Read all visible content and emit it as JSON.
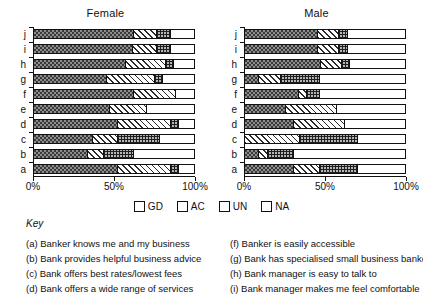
{
  "chart_data": {
    "type": "bar",
    "subtype": "stacked-horizontal-100-percent",
    "title": "",
    "panels": [
      {
        "title": "Female",
        "categories": [
          "a",
          "b",
          "c",
          "d",
          "e",
          "f",
          "g",
          "h",
          "i",
          "j"
        ],
        "series": [
          {
            "name": "GD",
            "values": [
              52,
              33,
              36,
              52,
              47,
              62,
              45,
              57,
              61,
              62
            ]
          },
          {
            "name": "AC",
            "values": [
              33,
              10,
              16,
              33,
              23,
              26,
              30,
              25,
              15,
              14
            ]
          },
          {
            "name": "UN",
            "values": [
              5,
              19,
              26,
              5,
              0,
              0,
              5,
              5,
              9,
              9
            ]
          },
          {
            "name": "NA",
            "values": [
              10,
              38,
              22,
              10,
              30,
              12,
              20,
              13,
              15,
              15
            ]
          }
        ],
        "xlabel": "",
        "ylabel": "",
        "xlim": [
          0,
          100
        ],
        "xticks": [
          0,
          50,
          100
        ],
        "xticklabels": [
          "0%",
          "50%",
          "100%"
        ],
        "grid": false
      },
      {
        "title": "Male",
        "categories": [
          "a",
          "b",
          "c",
          "d",
          "e",
          "f",
          "g",
          "h",
          "i",
          "j"
        ],
        "series": [
          {
            "name": "GD",
            "values": [
              30,
              8,
              0,
              30,
              25,
              33,
              8,
              47,
              45,
              45
            ]
          },
          {
            "name": "AC",
            "values": [
              16,
              6,
              34,
              32,
              32,
              5,
              14,
              13,
              13,
              13
            ]
          },
          {
            "name": "UN",
            "values": [
              24,
              16,
              36,
              0,
              0,
              8,
              24,
              5,
              6,
              6
            ]
          },
          {
            "name": "NA",
            "values": [
              30,
              70,
              30,
              38,
              43,
              54,
              54,
              35,
              36,
              36
            ]
          }
        ],
        "xlabel": "",
        "ylabel": "",
        "xlim": [
          0,
          100
        ],
        "xticks": [
          0,
          50,
          100
        ],
        "xticklabels": [
          "0%",
          "50%",
          "100%"
        ],
        "grid": false
      }
    ],
    "legend": {
      "position": "bottom-center",
      "entries": [
        {
          "label": "GD",
          "fill": "dense-stipple-grey",
          "color": "#8d8d8d"
        },
        {
          "label": "AC",
          "fill": "diagonal-hatch",
          "color": "#ffffff"
        },
        {
          "label": "UN",
          "fill": "cross-hatch-grid",
          "color": "#b5b5b5"
        },
        {
          "label": "NA",
          "fill": "solid-white",
          "color": "#ffffff"
        }
      ]
    },
    "key": {
      "title": "Key",
      "left_column": [
        "(a) Banker knows me and my business",
        "(b) Bank provides helpful business advice",
        "(c) Bank offers best rates/lowest fees",
        "(d) Bank offers a wide range of services"
      ],
      "right_column": [
        "(f) Banker is easily accessible",
        "(g) Bank has specialised small business bankers",
        "(h) Bank manager is easy to talk to",
        "(i) Bank manager makes me feel comfortable"
      ]
    }
  }
}
